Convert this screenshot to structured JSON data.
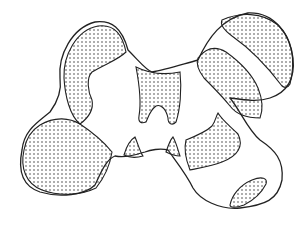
{
  "figure": {
    "colors": {
      "stroke": "#222222",
      "fill_background": "#ffffff",
      "stipple": "#333333"
    },
    "regions": [
      {
        "name": "upper-left-lobe-shaded"
      },
      {
        "name": "lower-left-lobe-shaded"
      },
      {
        "name": "center-w-shape-shaded"
      },
      {
        "name": "center-small-triangle-left"
      },
      {
        "name": "center-small-triangle-right"
      },
      {
        "name": "upper-right-cap-band-shaded"
      },
      {
        "name": "upper-right-inner-band-shaded"
      },
      {
        "name": "lower-right-lobe-shaded"
      },
      {
        "name": "lower-right-small-oval-shaded"
      }
    ]
  }
}
